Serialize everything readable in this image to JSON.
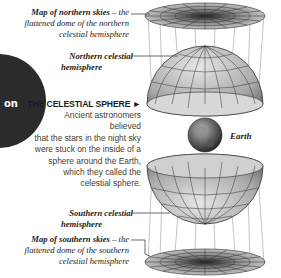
{
  "section_tab": {
    "text": "on"
  },
  "labels": {
    "north_map": {
      "line1": "Map of northern skies",
      "line1_rest": " – the",
      "line2": "flattened dome of the northern",
      "line3": "celestial hemisphere"
    },
    "north_hemisphere": {
      "line1": "Northern celestial",
      "line2": "hemisphere"
    },
    "earth": "Earth",
    "south_hemisphere": {
      "line1": "Southern celestial",
      "line2": "hemisphere"
    },
    "south_map": {
      "line1": "Map of southern skies",
      "line1_rest": " – the",
      "line2": "flattened dome of the southern",
      "line3": "celestial hemisphere"
    }
  },
  "caption": {
    "title": "THE CELESTIAL SPHERE",
    "arrow": "►",
    "lines": [
      "Ancient astronomers believed",
      "that the stars in the night sky",
      "were stuck on the inside of a",
      "sphere around the Earth,",
      "which they called the",
      "celestial sphere."
    ]
  },
  "colors": {
    "tab": "#2b2b2b",
    "caption_text": "#4a3c2c",
    "grid": "#333333",
    "dome_fill": "#bdbdbd"
  }
}
